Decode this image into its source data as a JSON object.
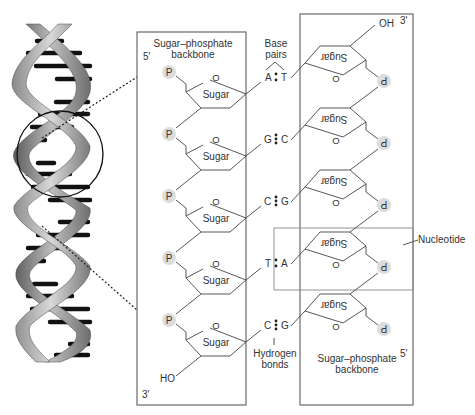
{
  "diagram": {
    "title_left_backbone": "Sugar–phosphate backbone",
    "title_left_backbone_lines": [
      "Sugar–phosphate",
      "backbone"
    ],
    "title_right_backbone_lines": [
      "Sugar–phosphate",
      "backbone"
    ],
    "base_pairs_label_lines": [
      "Base",
      "pairs"
    ],
    "hydrogen_bonds_label_lines": [
      "Hydrogen",
      "bonds"
    ],
    "nucleotide_label": "Nucleotide",
    "left_strand": {
      "top_end": "5'",
      "bottom_end": "3'",
      "terminal_group": "HO",
      "phosphate_label": "P",
      "ring_oxygen": "O",
      "sugar_label": "Sugar"
    },
    "right_strand": {
      "top_end": "3'",
      "bottom_end": "5'",
      "terminal_group": "OH",
      "phosphate_label": "P",
      "ring_oxygen": "O",
      "sugar_label": "Sugar",
      "orientation": "upside-down"
    },
    "base_pairs": [
      {
        "left": "A",
        "right": "T",
        "bonds": 2
      },
      {
        "left": "G",
        "right": "C",
        "bonds": 3
      },
      {
        "left": "C",
        "right": "G",
        "bonds": 3
      },
      {
        "left": "T",
        "right": "A",
        "bonds": 2
      },
      {
        "left": "C",
        "right": "G",
        "bonds": 3
      }
    ],
    "colors": {
      "line": "#444444",
      "box": "#6a6a6a",
      "phosphate_fill": "#dcdcdc",
      "helix_strand": "#8a8a8a",
      "helix_rung": "#111111"
    }
  }
}
